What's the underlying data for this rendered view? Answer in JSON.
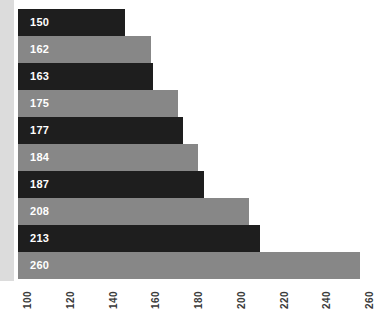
{
  "chart_data": {
    "type": "bar",
    "orientation": "horizontal",
    "title": "",
    "subtitle": "",
    "xlabel": "",
    "ylabel": "",
    "categories": [
      "",
      "",
      "",
      "",
      "",
      "",
      "",
      "",
      "",
      ""
    ],
    "values": [
      150,
      162,
      163,
      175,
      177,
      184,
      187,
      208,
      213,
      260
    ],
    "data_labels": [
      "150",
      "162",
      "163",
      "175",
      "177",
      "184",
      "187",
      "208",
      "213",
      "260"
    ],
    "bar_colors": [
      "#1e1e1e",
      "#878787",
      "#1e1e1e",
      "#878787",
      "#1e1e1e",
      "#878787",
      "#1e1e1e",
      "#878787",
      "#1e1e1e",
      "#878787"
    ],
    "xlim": [
      100,
      260
    ],
    "ylim": [
      0,
      10
    ],
    "xticks": [
      100,
      120,
      140,
      160,
      180,
      200,
      220,
      240,
      260
    ],
    "xtick_labels": [
      "100",
      "120",
      "140",
      "160",
      "180",
      "200",
      "220",
      "240",
      "260"
    ],
    "xtick_rotation": -90,
    "grid": false,
    "legend": false,
    "legend_position": "none",
    "annotations": [],
    "bars": [
      {
        "label": "150",
        "value": 150,
        "color": "#1e1e1e"
      },
      {
        "label": "162",
        "value": 162,
        "color": "#878787"
      },
      {
        "label": "163",
        "value": 163,
        "color": "#1e1e1e"
      },
      {
        "label": "175",
        "value": 175,
        "color": "#878787"
      },
      {
        "label": "177",
        "value": 177,
        "color": "#1e1e1e"
      },
      {
        "label": "184",
        "value": 184,
        "color": "#878787"
      },
      {
        "label": "187",
        "value": 187,
        "color": "#1e1e1e"
      },
      {
        "label": "208",
        "value": 208,
        "color": "#878787"
      },
      {
        "label": "213",
        "value": 213,
        "color": "#1e1e1e"
      },
      {
        "label": "260",
        "value": 260,
        "color": "#878787"
      }
    ]
  },
  "axis": {
    "title": ""
  },
  "colors": {
    "dark_bar": "#1e1e1e",
    "light_bar": "#878787",
    "label_text": "#ffffff",
    "tick_text": "#3a3a3a",
    "background": "#ffffff",
    "edge_band": "#dcdcdc"
  }
}
